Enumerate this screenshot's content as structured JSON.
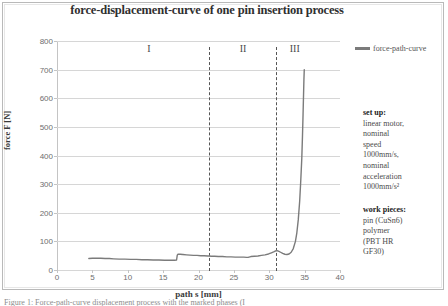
{
  "figure": {
    "title": "force-displacement-curve of one pin insertion process",
    "caption": "Figure 1: Force-path-curve displacement process with the marked phases (I"
  },
  "legend": {
    "label": "force-path-curve",
    "swatch_name": "legend-line-swatch",
    "color": "#7b7b7b",
    "position": "right"
  },
  "side_panel": {
    "setup": {
      "heading": "set up:",
      "lines": [
        "linear motor,",
        "nominal",
        "speed",
        "1000mm/s,",
        "nominal",
        "acceleration",
        "1000mm/s²"
      ]
    },
    "work_pieces": {
      "heading": "work pieces:",
      "lines": [
        "pin (CuSn6)",
        "polymer",
        "(PBT HR",
        "GF30)"
      ]
    }
  },
  "regions": [
    {
      "label": "I",
      "x": 13.0
    },
    {
      "label": "II",
      "x": 26.3
    },
    {
      "label": "III",
      "x": 33.6
    }
  ],
  "dividers": [
    21.5,
    31.0
  ],
  "chart_data": {
    "type": "line",
    "title": "force-displacement-curve of one pin insertion process",
    "xlabel": "path s [mm]",
    "ylabel": "force F [N]",
    "xlim": [
      0,
      40
    ],
    "ylim": [
      0,
      800
    ],
    "xticks": [
      0,
      5,
      10,
      15,
      20,
      25,
      30,
      35,
      40
    ],
    "yticks": [
      0,
      100,
      200,
      300,
      400,
      500,
      600,
      700,
      800
    ],
    "grid": true,
    "legend_position": "right",
    "series": [
      {
        "name": "force-path-curve",
        "color": "#7b7b7b",
        "x": [
          4.5,
          5.0,
          5.6,
          6.2,
          6.8,
          7.4,
          8.0,
          8.8,
          9.6,
          10.4,
          11.2,
          12.0,
          12.8,
          13.6,
          14.4,
          15.2,
          16.0,
          16.6,
          16.9,
          17.0,
          17.1,
          17.4,
          17.8,
          18.3,
          18.8,
          19.3,
          19.8,
          20.3,
          20.8,
          21.3,
          21.5,
          21.8,
          22.3,
          22.8,
          23.4,
          24.0,
          24.6,
          25.2,
          25.8,
          26.4,
          26.8,
          27.0,
          27.4,
          27.9,
          28.4,
          28.9,
          29.4,
          29.9,
          30.3,
          30.7,
          31.0,
          31.3,
          31.6,
          31.9,
          32.2,
          32.5,
          32.8,
          33.1,
          33.4,
          33.7,
          33.9,
          34.1,
          34.3,
          34.45,
          34.6,
          34.7,
          34.78,
          34.85,
          34.9,
          34.95
        ],
        "y": [
          40,
          41,
          41,
          41,
          40,
          40,
          39,
          38,
          38,
          37,
          37,
          36,
          36,
          35,
          35,
          34,
          34,
          34,
          35,
          52,
          55,
          55,
          54,
          53,
          52,
          51,
          51,
          50,
          50,
          49,
          49,
          48,
          48,
          47,
          47,
          46,
          46,
          45,
          45,
          45,
          44,
          44,
          47,
          48,
          49,
          51,
          53,
          56,
          60,
          64,
          68,
          66,
          62,
          58,
          55,
          54,
          56,
          62,
          75,
          100,
          130,
          175,
          240,
          310,
          390,
          470,
          545,
          615,
          665,
          700
        ]
      }
    ],
    "annotations": [
      {
        "text": "I",
        "x": 13.0,
        "y": 770,
        "type": "region-label"
      },
      {
        "text": "II",
        "x": 26.3,
        "y": 770,
        "type": "region-label"
      },
      {
        "text": "III",
        "x": 33.6,
        "y": 770,
        "type": "region-label"
      },
      {
        "text": "divider",
        "x": 21.5,
        "type": "vline-dashed"
      },
      {
        "text": "divider",
        "x": 31.0,
        "type": "vline-dashed"
      }
    ]
  }
}
